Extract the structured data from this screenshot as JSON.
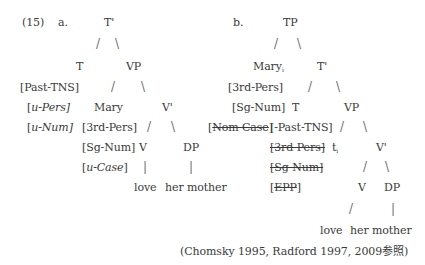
{
  "example_number": "(15)",
  "tree_a": {
    "label": "a.",
    "root": "T'",
    "t_head": "T",
    "vp": "VP",
    "past_tns": "[Past-TNS]",
    "u_pers_open": "[",
    "u_pers_u": "u",
    "u_pers_rest": "-Pers]",
    "u_num_open": "[",
    "u_num_u": "u",
    "u_num_rest": "-Num]",
    "subject": "Mary",
    "third_pers": "[3rd-Pers]",
    "sg_num": "[Sg-Num]",
    "u_case_open": "[",
    "u_case_text": "u-Case",
    "u_case_close": "]",
    "v_bar": "V'",
    "v": "V",
    "dp": "DP",
    "verb": "love",
    "object": "her mother"
  },
  "tree_b": {
    "label": "b.",
    "root": "TP",
    "subject": "Mary",
    "subject_index": "i",
    "t_bar": "T'",
    "third_pers": "[3rd-Pers]",
    "sg_num": "[Sg-Num]",
    "t_head": "T",
    "vp": "VP",
    "nom_case_open": "[",
    "nom_case": "Nom Case",
    "nom_case_close": "]",
    "past_tns": "[-Past-TNS]",
    "third_pers_struck": "[3rd-Pers]",
    "trace": "t",
    "trace_index": "i",
    "v_bar": "V'",
    "sg_num_struck": "[Sg-Num]",
    "epp_open": "[",
    "epp": "EPP",
    "epp_close": "]",
    "v": "V",
    "dp": "DP",
    "verb": "love",
    "object": "her mother"
  },
  "citation": "(Chomsky 1995, Radford 1997, 2009参照)",
  "branch_glyphs": {
    "left": "/",
    "right": "\\",
    "vertical": "|"
  }
}
